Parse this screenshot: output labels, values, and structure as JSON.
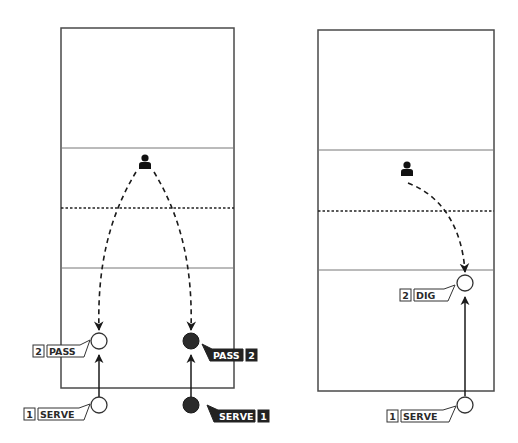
{
  "diagrams": [
    {
      "name": "left-court",
      "court": {
        "x": 61,
        "y": 28,
        "w": 173,
        "h": 360
      },
      "attack_line_top_y": 148,
      "net_y": 208,
      "attack_line_bottom_y": 268,
      "coach": {
        "x": 145,
        "y": 163
      },
      "players": [
        {
          "team": "white",
          "serve": {
            "x": 99,
            "y": 405,
            "label_num": "1",
            "label_text": "SERVE"
          },
          "pass": {
            "x": 99,
            "y": 341,
            "label_num": "2",
            "label_text": "PASS"
          }
        },
        {
          "team": "black",
          "serve": {
            "x": 191,
            "y": 405,
            "label_num": "1",
            "label_text": "SERVE"
          },
          "pass": {
            "x": 191,
            "y": 341,
            "label_num": "2",
            "label_text": "PASS"
          }
        }
      ]
    },
    {
      "name": "right-court",
      "court": {
        "x": 318,
        "y": 30,
        "w": 176,
        "h": 361
      },
      "attack_line_top_y": 150,
      "net_y": 211,
      "attack_line_bottom_y": 270,
      "coach": {
        "x": 407,
        "y": 170
      },
      "players": [
        {
          "team": "white",
          "serve": {
            "x": 465,
            "y": 405,
            "label_num": "1",
            "label_text": "SERVE"
          },
          "dig": {
            "x": 465,
            "y": 283,
            "label_num": "2",
            "label_text": "DIG"
          }
        }
      ]
    }
  ],
  "labels": {
    "left_white_serve_num": "1",
    "left_white_serve_text": "SERVE",
    "left_white_pass_num": "2",
    "left_white_pass_text": "PASS",
    "left_black_serve_num": "1",
    "left_black_serve_text": "SERVE",
    "left_black_pass_num": "2",
    "left_black_pass_text": "PASS",
    "right_serve_num": "1",
    "right_serve_text": "SERVE",
    "right_dig_num": "2",
    "right_dig_text": "DIG"
  },
  "colors": {
    "court_line": "#4a4a4a",
    "black_team": "#2b2b2b",
    "white_team": "#ffffff"
  },
  "icons": {
    "coach": "person-icon",
    "position": "circle-marker",
    "arrow": "arrowhead"
  }
}
